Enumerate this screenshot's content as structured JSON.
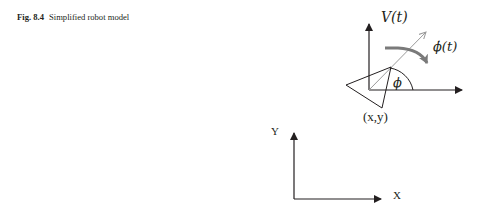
{
  "caption": {
    "figure_label": "Fig. 8.4",
    "title": "Simplified robot model"
  },
  "figure": {
    "robot_frame": {
      "velocity_label": "V(t)",
      "angular_velocity_label": "ϕ̇(t)",
      "heading_angle_label": "ϕ",
      "position_label": "(x,y)"
    },
    "world_frame": {
      "x_axis_label": "X",
      "y_axis_label": "Y"
    },
    "colors": {
      "line": "#231f20",
      "heading_line": "#9a9a9a",
      "rotation_arrow": "#7a7a7a"
    }
  }
}
